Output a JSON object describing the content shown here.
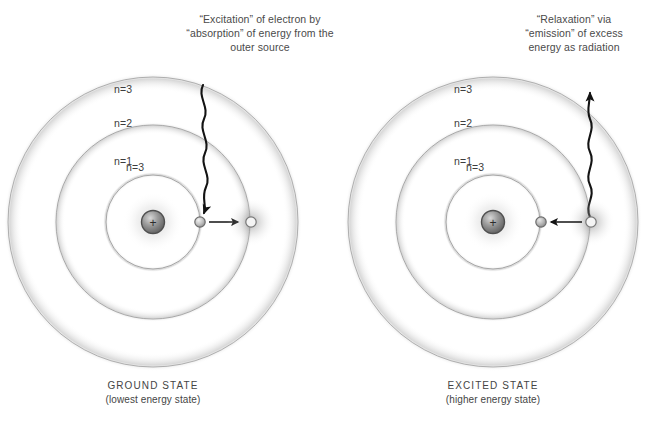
{
  "background": "#ffffff",
  "ink": "#3a3a3a",
  "shell_stroke": "#9a9a9a",
  "nucleus_color": "#8a8a8a",
  "electron_color": "#b4b4b4",
  "arrow_color": "#1a1a1a",
  "panels": [
    {
      "id": "ground",
      "caption": [
        "“Excitation” of electron by",
        "“absorption” of energy from the",
        "outer source"
      ],
      "shells": [
        {
          "label": "n=1",
          "index": 1
        },
        {
          "label": "n=2",
          "index": 2
        },
        {
          "label": "n=3",
          "index": 3
        }
      ],
      "nucleus_charge": "+",
      "electron_from_shell": 1,
      "electron_to_shell": 3,
      "transition_direction": "outward",
      "photon_direction": "incoming",
      "state_title": "GROUND STATE",
      "state_sub": "(lowest energy state)"
    },
    {
      "id": "excited",
      "caption": [
        "“Relaxation” via",
        "“emission” of excess",
        "energy as radiation"
      ],
      "shells": [
        {
          "label": "n=1",
          "index": 1
        },
        {
          "label": "n=2",
          "index": 2
        },
        {
          "label": "n=3",
          "index": 3
        }
      ],
      "nucleus_charge": "+",
      "electron_from_shell": 3,
      "electron_to_shell": 2,
      "transition_direction": "inward",
      "photon_direction": "outgoing",
      "state_title": "EXCITED STATE",
      "state_sub": "(higher energy state)"
    }
  ]
}
